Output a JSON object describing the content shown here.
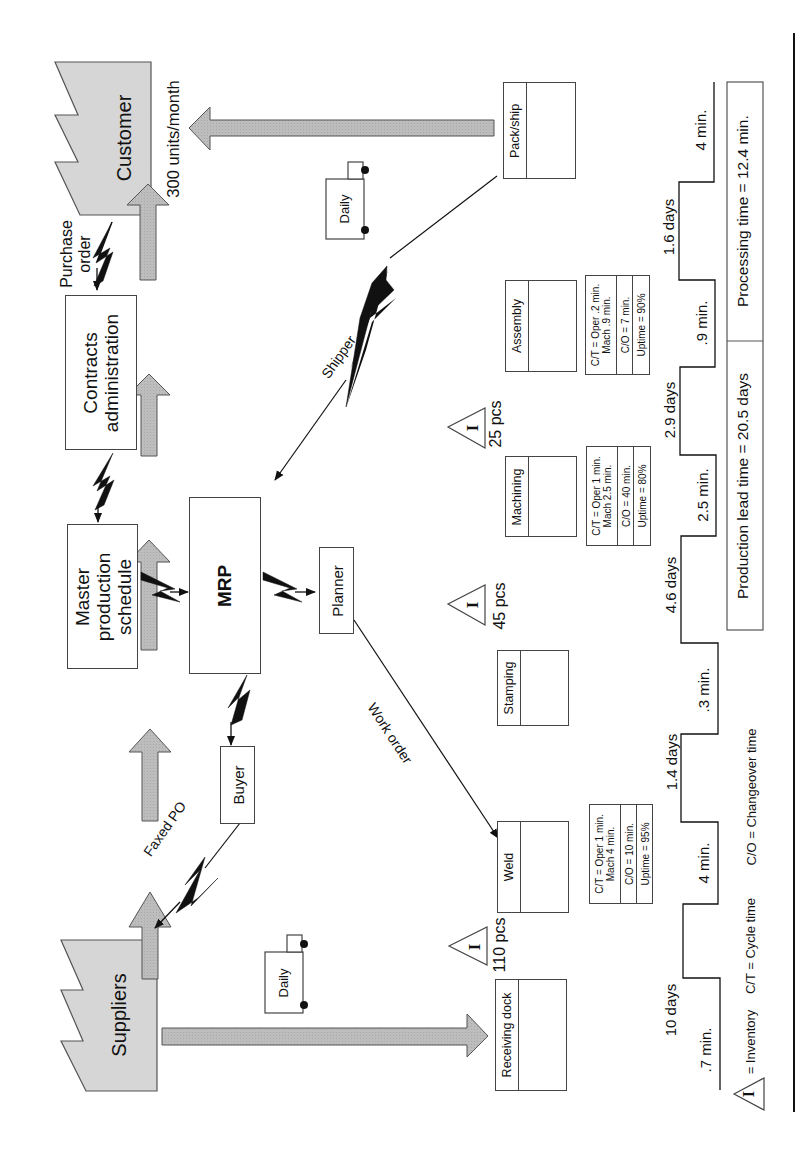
{
  "external": {
    "customer": {
      "label": "Customer",
      "demand": "300 units/month"
    },
    "suppliers": {
      "label": "Suppliers"
    }
  },
  "info_flow": {
    "contracts": "Contracts administration",
    "contracts_line1": "Contracts",
    "contracts_line2": "administration",
    "mps_line1": "Master",
    "mps_line2": "production",
    "mps_line3": "schedule",
    "mrp": "MRP",
    "planner": "Planner",
    "buyer": "Buyer",
    "purchase_order_line1": "Purchase",
    "purchase_order_line2": "order",
    "faxed_po": "Faxed PO",
    "shipper": "Shipper",
    "work_order": "Work order"
  },
  "shipments": {
    "supplier_truck": "Daily",
    "customer_truck": "Daily"
  },
  "processes": [
    {
      "name": "Receiving dock"
    },
    {
      "name": "Weld",
      "ct_line1": "C/T = Oper 1 min.",
      "ct_line2": "Mach 4 min.",
      "co": "C/O = 10 min.",
      "uptime": "Uptime = 95%"
    },
    {
      "name": "Stamping"
    },
    {
      "name": "Machining",
      "ct_line1": "C/T = Oper 1 min.",
      "ct_line2": "Mach 2.5 min.",
      "co": "C/O = 40 min.",
      "uptime": "Uptime = 80%"
    },
    {
      "name": "Assembly",
      "ct_line1": "C/T = Oper .2 min.",
      "ct_line2": "Mach .9 min.",
      "co": "C/O = 7 min.",
      "uptime": "Uptime = 90%"
    },
    {
      "name": "Pack/ship"
    }
  ],
  "inventory": [
    {
      "symbol": "I",
      "qty": "110 pcs"
    },
    {
      "symbol": "I",
      "qty": "45 pcs"
    },
    {
      "symbol": "I",
      "qty": "25 pcs"
    }
  ],
  "timeline": {
    "process_times": [
      ".7 min.",
      "4 min.",
      ".3 min.",
      "2.5 min.",
      ".9 min.",
      "4 min."
    ],
    "wait_times": [
      "10 days",
      "1.4 days",
      "4.6 days",
      "2.9 days",
      "1.6 days"
    ],
    "lead_time": "Production lead time = 20.5 days",
    "processing_time": "Processing time = 12.4 min."
  },
  "legend": {
    "inventory_symbol": "I",
    "inventory": "= Inventory",
    "cycle_time": "C/T = Cycle time",
    "changeover": "C/O = Changeover time"
  },
  "colors": {
    "factory_fill": "#d4d4d4",
    "arrow_fill": "#b8b8b8",
    "stroke": "#333333"
  }
}
